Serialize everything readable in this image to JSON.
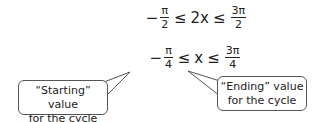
{
  "equations": {
    "line1": {
      "left_sign": "−",
      "left_num": "π",
      "left_den": "2",
      "op1": "≤",
      "middle": "2x",
      "op2": "≤",
      "right_num": "3π",
      "right_den": "2"
    },
    "line2": {
      "left_sign": "−",
      "left_num": "π",
      "left_den": "4",
      "op1": "≤",
      "middle": "x",
      "op2": "≤",
      "right_num": "3π",
      "right_den": "4"
    }
  },
  "callouts": {
    "start": {
      "line1": "“Starting” value",
      "line2": "for the cycle"
    },
    "end": {
      "line1": "“Ending” value",
      "line2": "for the cycle"
    }
  },
  "colors": {
    "text": "#222222",
    "border": "#555555",
    "background": "#ffffff"
  }
}
